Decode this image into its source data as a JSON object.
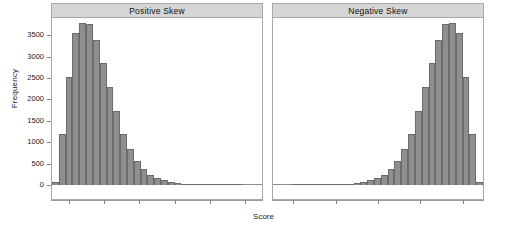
{
  "chart_data": {
    "type": "bar",
    "title": "",
    "xlabel": "Score",
    "ylabel": "Frequency",
    "ylim": [
      0,
      3900
    ],
    "yticks": [
      0,
      500,
      1000,
      1500,
      2000,
      2500,
      3000,
      3500
    ],
    "ytick_labels": [
      "0",
      "500",
      "1000",
      "1500",
      "2000",
      "2500",
      "3000",
      "3500"
    ],
    "grid": false,
    "legend": null,
    "layout": "two side-by-side lattice panels with gray strip headers",
    "bar_fill": "#8f8f8f",
    "bar_border": "#6b6b6b",
    "strip_fill": "#d6d6d6",
    "panel_border": "#a8a8a8",
    "panels": [
      {
        "label": "Positive Skew",
        "xtick_count": 6,
        "values": [
          60,
          1190,
          2530,
          3550,
          3790,
          3750,
          3380,
          2860,
          2280,
          1720,
          1200,
          840,
          560,
          380,
          240,
          160,
          110,
          70,
          45,
          30,
          20,
          12,
          8,
          5,
          3,
          2,
          1,
          1,
          0,
          0,
          0,
          0
        ]
      },
      {
        "label": "Negative Skew",
        "xtick_count": 5,
        "values": [
          0,
          0,
          0,
          0,
          1,
          1,
          2,
          3,
          5,
          8,
          12,
          20,
          30,
          45,
          70,
          110,
          160,
          240,
          380,
          560,
          840,
          1200,
          1720,
          2280,
          2860,
          3380,
          3750,
          3790,
          3550,
          2530,
          1190,
          60
        ]
      }
    ]
  }
}
